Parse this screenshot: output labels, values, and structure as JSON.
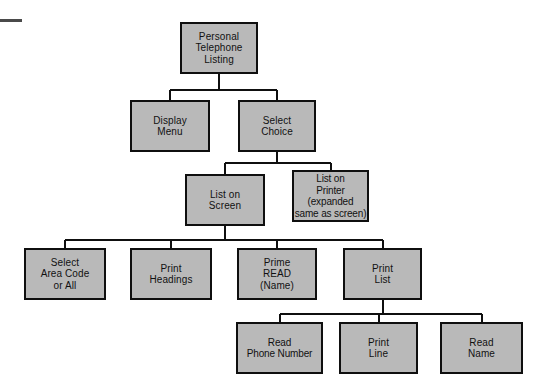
{
  "diagram": {
    "type": "hierarchy-structure-chart",
    "colors": {
      "box_fill": "#b9b9b9",
      "box_border": "#0f0f0f",
      "line": "#0f0f0f",
      "text": "#111111",
      "background": "#ffffff",
      "corner_mark": "#4a4a4a"
    },
    "nodes": [
      {
        "id": "personal-telephone-listing",
        "label": "Personal\nTelephone\nListing",
        "level": 0,
        "x": 180,
        "y": 22,
        "w": 78,
        "h": 52
      },
      {
        "id": "display-menu",
        "label": "Display\nMenu",
        "level": 1,
        "x": 130,
        "y": 100,
        "w": 80,
        "h": 52
      },
      {
        "id": "select-choice",
        "label": "Select\nChoice",
        "level": 1,
        "x": 238,
        "y": 100,
        "w": 78,
        "h": 52
      },
      {
        "id": "list-on-screen",
        "label": "List on\nScreen",
        "level": 2,
        "x": 185,
        "y": 174,
        "w": 80,
        "h": 52
      },
      {
        "id": "list-on-printer",
        "label": "List on\nPrinter\n(expanded\nsame as screen)",
        "level": 2,
        "x": 292,
        "y": 170,
        "w": 77,
        "h": 52
      },
      {
        "id": "select-area-code-or-all",
        "label": "Select\nArea Code\nor All",
        "level": 3,
        "x": 24,
        "y": 248,
        "w": 82,
        "h": 52
      },
      {
        "id": "print-headings",
        "label": "Print\nHeadings",
        "level": 3,
        "x": 130,
        "y": 248,
        "w": 82,
        "h": 52
      },
      {
        "id": "prime-read-name",
        "label": "Prime\nREAD\n(Name)",
        "level": 3,
        "x": 237,
        "y": 248,
        "w": 80,
        "h": 52
      },
      {
        "id": "print-list",
        "label": "Print\nList",
        "level": 3,
        "x": 343,
        "y": 248,
        "w": 79,
        "h": 52
      },
      {
        "id": "read-phone-number",
        "label": "Read\nPhone Number",
        "level": 4,
        "x": 236,
        "y": 322,
        "w": 87,
        "h": 52
      },
      {
        "id": "print-line",
        "label": "Print\nLine",
        "level": 4,
        "x": 339,
        "y": 322,
        "w": 79,
        "h": 52
      },
      {
        "id": "read-name",
        "label": "Read\nName",
        "level": 4,
        "x": 440,
        "y": 322,
        "w": 83,
        "h": 52
      }
    ],
    "edges": [
      {
        "from": "personal-telephone-listing",
        "to": "display-menu"
      },
      {
        "from": "personal-telephone-listing",
        "to": "select-choice"
      },
      {
        "from": "select-choice",
        "to": "list-on-screen"
      },
      {
        "from": "select-choice",
        "to": "list-on-printer"
      },
      {
        "from": "list-on-screen",
        "to": "select-area-code-or-all"
      },
      {
        "from": "list-on-screen",
        "to": "print-headings"
      },
      {
        "from": "list-on-screen",
        "to": "prime-read-name"
      },
      {
        "from": "list-on-screen",
        "to": "print-list"
      },
      {
        "from": "print-list",
        "to": "read-phone-number"
      },
      {
        "from": "print-list",
        "to": "print-line"
      },
      {
        "from": "print-list",
        "to": "read-name"
      }
    ],
    "corner_mark": {
      "x": 0,
      "y": 19,
      "w": 22,
      "h": 3
    }
  }
}
